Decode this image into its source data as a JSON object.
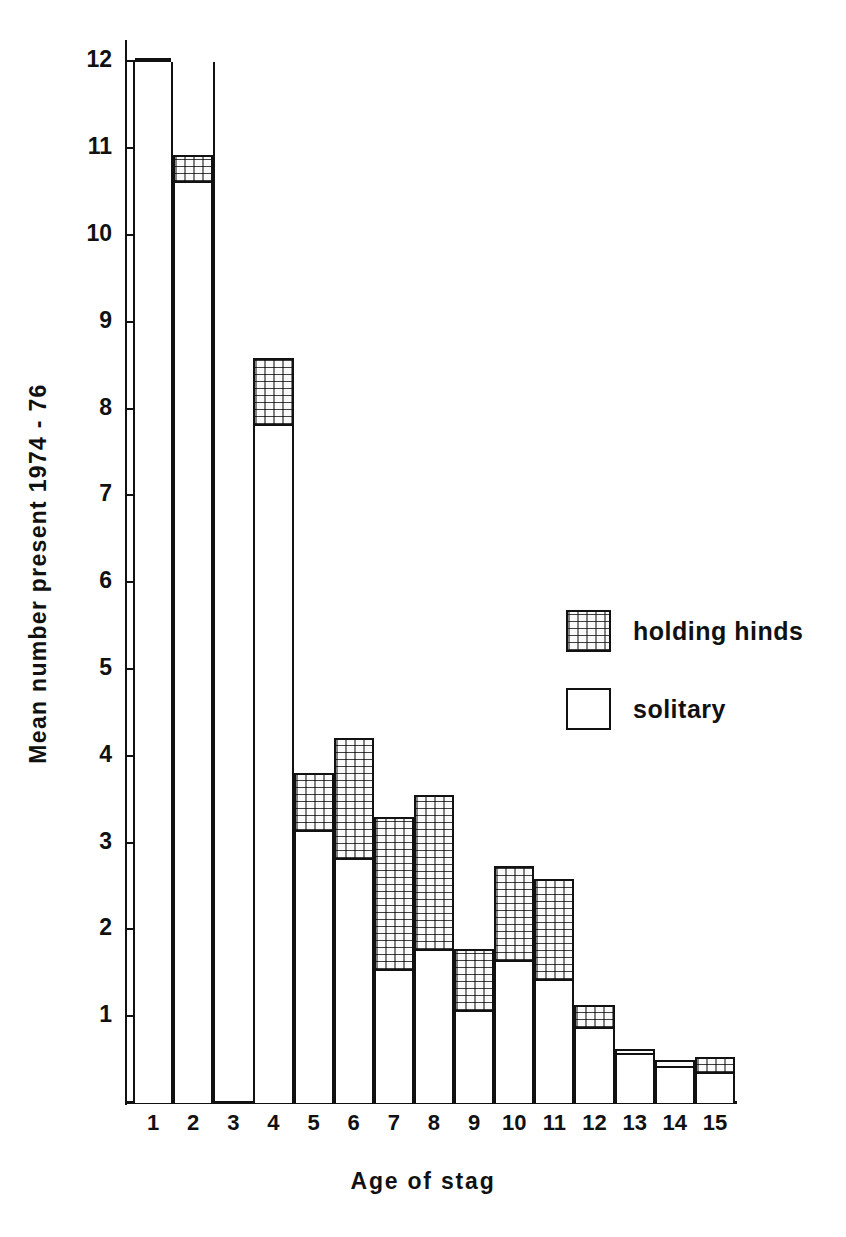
{
  "chart_data": {
    "type": "bar",
    "subtype": "stacked-bar",
    "title": "",
    "xlabel": "Age of stag",
    "ylabel": "Mean number present 1974 - 76",
    "categories": [
      "1",
      "2",
      "3",
      "4",
      "5",
      "6",
      "7",
      "8",
      "9",
      "10",
      "11",
      "12",
      "13",
      "14",
      "15"
    ],
    "ylim": [
      0,
      13.3
    ],
    "yticks": [
      1,
      2,
      3,
      4,
      5,
      6,
      7,
      8,
      9,
      10,
      11,
      12,
      13
    ],
    "ytick_labels": [
      "1",
      "2",
      "3",
      "4",
      "5",
      "6",
      "7",
      "8",
      "9",
      "10",
      "11",
      "12",
      "13"
    ],
    "grid": false,
    "legend_position": "inside-right",
    "series": [
      {
        "name": "solitary",
        "fill": "white",
        "values": [
          12.78,
          10.6,
          0,
          7.8,
          3.12,
          2.8,
          1.52,
          1.75,
          1.05,
          1.63,
          1.4,
          0.85,
          0.55,
          0.4,
          0.33
        ]
      },
      {
        "name": "holding hinds",
        "fill": "stipple",
        "values": [
          0.22,
          0.32,
          0,
          0.78,
          0.68,
          1.4,
          1.78,
          1.8,
          0.72,
          1.1,
          1.18,
          0.28,
          0.07,
          0.1,
          0.2
        ]
      }
    ],
    "totals": [
      13.0,
      10.92,
      0,
      8.58,
      3.8,
      4.2,
      3.3,
      3.55,
      1.77,
      2.73,
      2.58,
      1.13,
      0.62,
      0.5,
      0.53
    ]
  },
  "axes": {
    "y_title": "Mean number present 1974 - 76",
    "x_title": "Age of stag"
  },
  "legend": {
    "items": [
      {
        "label": "holding hinds",
        "swatch": "stipple-swatch"
      },
      {
        "label": "solitary",
        "swatch": "white-swatch"
      }
    ]
  },
  "colors": {
    "ink": "#111111",
    "paper": "#ffffff",
    "stipple": "#fafafa"
  }
}
